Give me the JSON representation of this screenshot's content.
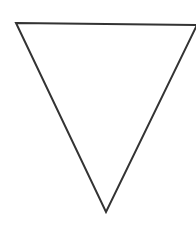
{
  "diagram": {
    "shape": "inverted-triangle",
    "fill": "#ffffff",
    "stroke": "#333333",
    "stroke_width": 2,
    "vertices": {
      "top_left": [
        16,
        23
      ],
      "top_right": [
        197,
        25
      ],
      "bottom": [
        106,
        212
      ]
    }
  }
}
